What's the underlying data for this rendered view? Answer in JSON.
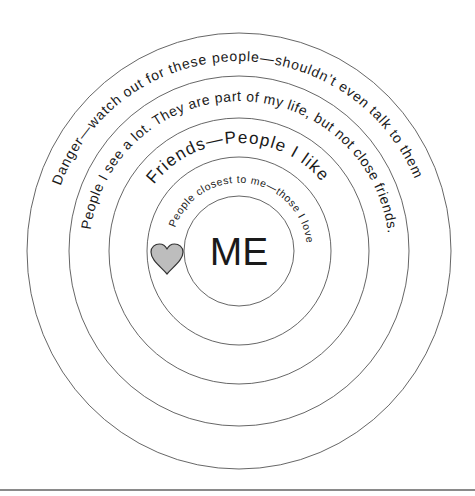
{
  "diagram": {
    "type": "concentric-circles",
    "center_label": "ME",
    "rings": [
      {
        "level": 1,
        "label": "People closest to me—those I love"
      },
      {
        "level": 2,
        "label": "Friends—People I like"
      },
      {
        "level": 3,
        "label": "People I see a lot. They are part of my life, but not close friends."
      },
      {
        "level": 4,
        "label": "Danger—watch out for these people—shouldn’t even talk to them"
      }
    ],
    "icons": [
      {
        "name": "heart-icon",
        "fill": "#bdbdbd",
        "stroke": "#333333"
      }
    ],
    "colors": {
      "background": "#ffffff",
      "ring_stroke": "#555555",
      "text": "#1a1a1a",
      "rule": "#8a8a8a"
    }
  }
}
